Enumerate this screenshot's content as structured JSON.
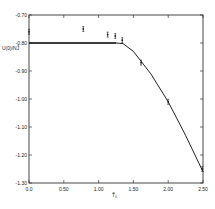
{
  "chart_data": {
    "type": "line",
    "title": "",
    "xlabel": "T̃₀",
    "ylabel": "U(0)/NJ̃",
    "xlim": [
      0.0,
      2.5
    ],
    "ylim": [
      -1.3,
      -0.7
    ],
    "x_ticks": [
      "0.0",
      "0.50",
      "1.00",
      "1.50",
      "2.00",
      "2.50"
    ],
    "y_ticks": [
      "-0.70",
      "-0.80",
      "-0.90",
      "-1.00",
      "-1.10",
      "-1.20",
      "-1.30"
    ],
    "grid": false,
    "legend": null,
    "series": [
      {
        "name": "data points (with error bars)",
        "style": "scatter-errorbar",
        "x": [
          0.0,
          0.78,
          1.13,
          1.24,
          1.34,
          1.61,
          2.0,
          2.49
        ],
        "y": [
          -0.76,
          -0.75,
          -0.77,
          -0.775,
          -0.79,
          -0.87,
          -1.01,
          -1.25
        ]
      },
      {
        "name": "fit curve",
        "style": "line",
        "x": [
          0.0,
          1.25,
          1.35,
          1.5,
          1.75,
          2.0,
          2.25,
          2.5
        ],
        "y": [
          -0.8,
          -0.8,
          -0.802,
          -0.83,
          -0.91,
          -1.01,
          -1.13,
          -1.26
        ]
      }
    ]
  }
}
